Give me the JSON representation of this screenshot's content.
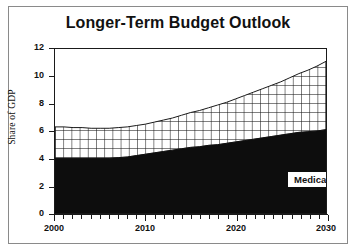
{
  "chart_data": {
    "type": "area",
    "title": "Longer-Term Budget Outlook",
    "xlabel": "",
    "ylabel": "Share of GDP",
    "xlim": [
      2000,
      2030
    ],
    "ylim": [
      0,
      12
    ],
    "grid": false,
    "stacked": true,
    "legend_position": "inline-annotations",
    "x_ticks": [
      2000,
      2010,
      2020,
      2030
    ],
    "x_minor_tick_interval": 1,
    "y_ticks": [
      0,
      2,
      4,
      6,
      8,
      10,
      12
    ],
    "x": [
      2000,
      2001,
      2002,
      2003,
      2004,
      2005,
      2006,
      2007,
      2008,
      2009,
      2010,
      2011,
      2012,
      2013,
      2014,
      2015,
      2016,
      2017,
      2018,
      2019,
      2020,
      2021,
      2022,
      2023,
      2024,
      2025,
      2026,
      2027,
      2028,
      2029,
      2030
    ],
    "series": [
      {
        "name": "Social Security",
        "fill": "black",
        "values": [
          4.0,
          4.0,
          4.0,
          4.0,
          4.0,
          4.0,
          4.0,
          4.05,
          4.1,
          4.2,
          4.3,
          4.4,
          4.5,
          4.6,
          4.7,
          4.8,
          4.85,
          4.95,
          5.0,
          5.1,
          5.2,
          5.3,
          5.4,
          5.5,
          5.6,
          5.7,
          5.8,
          5.9,
          5.95,
          6.0,
          6.1
        ]
      },
      {
        "name": "Medicare",
        "fill": "cross-hatch",
        "values": [
          2.3,
          2.3,
          2.25,
          2.25,
          2.2,
          2.2,
          2.2,
          2.2,
          2.2,
          2.2,
          2.2,
          2.25,
          2.3,
          2.35,
          2.45,
          2.55,
          2.65,
          2.75,
          2.9,
          3.0,
          3.15,
          3.3,
          3.45,
          3.6,
          3.75,
          3.9,
          4.1,
          4.3,
          4.5,
          4.75,
          5.0
        ]
      }
    ],
    "totals": [
      6.3,
      6.3,
      6.25,
      6.25,
      6.2,
      6.2,
      6.2,
      6.25,
      6.3,
      6.4,
      6.5,
      6.65,
      6.8,
      6.95,
      7.15,
      7.35,
      7.5,
      7.7,
      7.9,
      8.1,
      8.35,
      8.6,
      8.85,
      9.1,
      9.35,
      9.6,
      9.9,
      10.2,
      10.45,
      10.75,
      11.1
    ],
    "annotations": [
      {
        "text": "Medicare",
        "x": 2026,
        "y": 8.0
      },
      {
        "text": "Social Security",
        "x": 2022,
        "y": 2.5
      }
    ]
  },
  "chart": {
    "title": "Longer-Term Budget Outlook",
    "y_axis_title": "Share of GDP",
    "y_tick_labels": [
      "12",
      "10",
      "8",
      "6",
      "4",
      "2",
      "0"
    ],
    "x_tick_labels": [
      "2000",
      "2010",
      "2020",
      "2030"
    ],
    "label_medicare": "Medicare",
    "label_social_security": "Social Security"
  },
  "colors": {
    "social_security_fill": "#0d0d0d",
    "medicare_hatch_line": "#1a1a1a",
    "medicare_fill": "#ffffff",
    "axis": "#1a1a1a",
    "frame": "#8a8a8a",
    "text": "#111111",
    "background": "#ffffff"
  }
}
